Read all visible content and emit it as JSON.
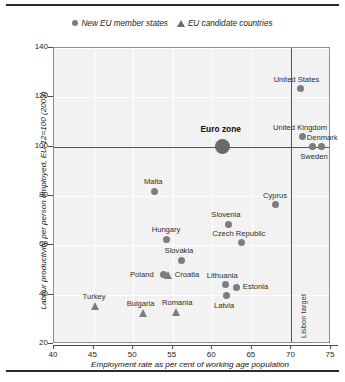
{
  "legend": {
    "items": [
      {
        "label": "New EU member states",
        "marker": "circle-marker-icon"
      },
      {
        "label": "EU candidate countries",
        "marker": "triangle-marker-icon"
      }
    ]
  },
  "annotations": {
    "lisbon_target": "Lisbon target"
  },
  "chart_data": {
    "type": "scatter",
    "title": "",
    "xlabel": "Employment rate as per cent of working age population",
    "ylabel": "Labour productivity per person employed, EU-12=100 (2003)",
    "xlim": [
      40,
      75
    ],
    "ylim": [
      20,
      140
    ],
    "xticks": [
      40,
      45,
      50,
      55,
      60,
      65,
      70,
      75
    ],
    "yticks": [
      20,
      40,
      60,
      80,
      100,
      120,
      140
    ],
    "grid": true,
    "legend_position": "top-center",
    "reference_lines": [
      {
        "name": "EU-12 index",
        "axis": "y",
        "value": 100
      },
      {
        "name": "Lisbon target",
        "axis": "x",
        "value": 70,
        "label": "Lisbon target"
      }
    ],
    "series": [
      {
        "name": "New EU member states",
        "marker": "circle",
        "points": [
          {
            "label": "Malta",
            "x": 52.7,
            "y": 82.0,
            "label_pos": "above"
          },
          {
            "label": "Hungary",
            "x": 54.2,
            "y": 62.5,
            "label_pos": "above"
          },
          {
            "label": "Slovakia",
            "x": 56.1,
            "y": 54.0,
            "label_pos": "above"
          },
          {
            "label": "Poland",
            "x": 53.8,
            "y": 48.0,
            "label_pos": "left"
          },
          {
            "label": "Slovenia",
            "x": 62.0,
            "y": 68.5,
            "label_pos": "above"
          },
          {
            "label": "Czech Republic",
            "x": 63.7,
            "y": 61.0,
            "label_pos": "above"
          },
          {
            "label": "Cyprus",
            "x": 68.0,
            "y": 76.5,
            "label_pos": "above"
          },
          {
            "label": "Lithuania",
            "x": 61.7,
            "y": 44.0,
            "label_pos": "above"
          },
          {
            "label": "Estonia",
            "x": 63.1,
            "y": 43.0,
            "label_pos": "right"
          },
          {
            "label": "Latvia",
            "x": 61.8,
            "y": 39.5,
            "label_pos": "below"
          },
          {
            "label": "Euro zone",
            "x": 61.3,
            "y": 100.0,
            "label_pos": "above",
            "emphasis": true
          },
          {
            "label": "United States",
            "x": 71.2,
            "y": 123.5,
            "label_pos": "above"
          },
          {
            "label": "United Kingdom",
            "x": 71.4,
            "y": 104.0,
            "label_pos": "above"
          },
          {
            "label": "Sweden",
            "x": 72.7,
            "y": 100.0,
            "label_pos": "below"
          },
          {
            "label": "Denmark",
            "x": 73.8,
            "y": 100.0,
            "label_pos": "above"
          }
        ]
      },
      {
        "name": "EU candidate countries",
        "marker": "triangle",
        "points": [
          {
            "label": "Croatia",
            "x": 54.5,
            "y": 48.0,
            "label_pos": "right"
          },
          {
            "label": "Turkey",
            "x": 45.2,
            "y": 35.5,
            "label_pos": "above"
          },
          {
            "label": "Bulgaria",
            "x": 51.3,
            "y": 32.5,
            "label_pos": "above"
          },
          {
            "label": "Romania",
            "x": 55.5,
            "y": 33.0,
            "label_pos": "above"
          }
        ]
      }
    ]
  }
}
